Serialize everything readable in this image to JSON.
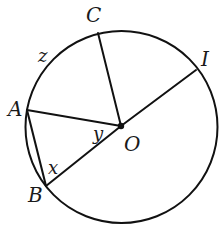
{
  "diagram": {
    "type": "circle-geometry",
    "circle": {
      "center": "O",
      "cx": 121.5,
      "cy": 127,
      "r": 96,
      "stroke": "#111111"
    },
    "points": {
      "O": {
        "label": "O",
        "x": 121,
        "y": 126,
        "lx": 124,
        "ly": 151
      },
      "C": {
        "label": "C",
        "x": 98,
        "y": 33,
        "lx": 86,
        "ly": 22
      },
      "I": {
        "label": "I",
        "x": 196,
        "y": 70,
        "lx": 201,
        "ly": 66
      },
      "A": {
        "label": "A",
        "x": 27,
        "y": 110,
        "lx": 8,
        "ly": 116
      },
      "B": {
        "label": "B",
        "x": 46,
        "y": 186,
        "lx": 28,
        "ly": 202
      }
    },
    "segments": [
      {
        "name": "segment-OC",
        "from": "O",
        "to": "C"
      },
      {
        "name": "segment-OI",
        "from": "O",
        "to": "I"
      },
      {
        "name": "segment-OA",
        "from": "O",
        "to": "A"
      },
      {
        "name": "segment-OB",
        "from": "O",
        "to": "B"
      },
      {
        "name": "segment-AB",
        "from": "A",
        "to": "B"
      }
    ],
    "angle_labels": {
      "x": {
        "label": "x",
        "lx": 48,
        "ly": 174
      },
      "y": {
        "label": "y",
        "lx": 93,
        "ly": 140
      },
      "z": {
        "label": "z",
        "lx": 38,
        "ly": 62
      }
    }
  }
}
